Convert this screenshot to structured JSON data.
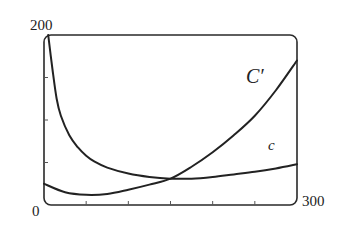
{
  "chart_data": {
    "type": "line",
    "title": "",
    "xlabel": "",
    "ylabel": "",
    "xlim": [
      0,
      300
    ],
    "ylim": [
      0,
      200
    ],
    "x_tick_labels": [
      "0",
      "300"
    ],
    "y_tick_labels": [
      "200"
    ],
    "x_minor_ticks": [
      50,
      100,
      150,
      200,
      250
    ],
    "y_minor_ticks": [
      50,
      100,
      150
    ],
    "grid": false,
    "legend": "none (curves labeled inline)",
    "series": [
      {
        "name": "c",
        "label": "c",
        "x": [
          5,
          10,
          15,
          20,
          30,
          40,
          50,
          60,
          75,
          100,
          125,
          150,
          175,
          200,
          225,
          250,
          275,
          300
        ],
        "values": [
          200,
          160,
          125,
          105,
          82,
          68,
          58,
          51,
          44,
          37,
          33,
          31,
          31,
          33,
          36,
          39,
          43,
          48
        ]
      },
      {
        "name": "C'",
        "label": "C′",
        "x": [
          0,
          25,
          50,
          75,
          100,
          125,
          150,
          175,
          200,
          225,
          250,
          275,
          300
        ],
        "values": [
          25,
          15,
          12,
          13,
          18,
          24,
          31,
          45,
          62,
          82,
          105,
          135,
          170
        ]
      }
    ],
    "annotations": [
      {
        "text": "C′",
        "x": 230,
        "y": 140
      },
      {
        "text": "c",
        "x": 270,
        "y": 60
      }
    ]
  },
  "labels": {
    "y_max": "200",
    "origin": "0",
    "x_max": "300",
    "c_prime": "C′",
    "c": "c"
  }
}
